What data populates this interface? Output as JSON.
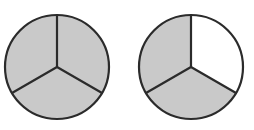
{
  "figure": {
    "background_color": "#ffffff",
    "canvas": {
      "width": 254,
      "height": 130
    },
    "stroke_color": "#2b2b2b",
    "shaded_color": "#c9c9c9",
    "unshaded_color": "#ffffff",
    "stroke_width": 2.2,
    "sector_count": 3,
    "circles": [
      {
        "name": "left-circle",
        "label": "Circle 1 — three thirds shaded",
        "center_x": 57,
        "center_y": 67,
        "radius": 52,
        "shaded_sectors": 3,
        "total_sectors": 3,
        "fraction": "3/3",
        "sectors": [
          {
            "name": "top-right-sector",
            "start_angle_deg": 90,
            "end_angle_deg": -30,
            "shaded": true
          },
          {
            "name": "bottom-sector",
            "start_angle_deg": -30,
            "end_angle_deg": -150,
            "shaded": true
          },
          {
            "name": "top-left-sector",
            "start_angle_deg": -150,
            "end_angle_deg": -270,
            "shaded": true
          }
        ]
      },
      {
        "name": "right-circle",
        "label": "Circle 2 — two thirds shaded",
        "center_x": 191,
        "center_y": 67,
        "radius": 52,
        "shaded_sectors": 2,
        "total_sectors": 3,
        "fraction": "2/3",
        "sectors": [
          {
            "name": "top-right-sector",
            "start_angle_deg": 90,
            "end_angle_deg": -30,
            "shaded": false
          },
          {
            "name": "bottom-sector",
            "start_angle_deg": -30,
            "end_angle_deg": -150,
            "shaded": true
          },
          {
            "name": "top-left-sector",
            "start_angle_deg": -150,
            "end_angle_deg": -270,
            "shaded": true
          }
        ]
      }
    ]
  },
  "chart_data": {
    "type": "pie",
    "xlabel": "",
    "ylabel": "",
    "legend_position": "none",
    "grid": false,
    "series": [
      {
        "name": "Circle 1",
        "categories": [
          "top-right",
          "bottom",
          "top-left"
        ],
        "values": [
          33.3,
          33.3,
          33.3
        ],
        "shaded": [
          true,
          true,
          true
        ],
        "shaded_count": 3,
        "total_count": 3,
        "fraction": "3/3"
      },
      {
        "name": "Circle 2",
        "categories": [
          "top-right",
          "bottom",
          "top-left"
        ],
        "values": [
          33.3,
          33.3,
          33.3
        ],
        "shaded": [
          false,
          true,
          true
        ],
        "shaded_count": 2,
        "total_count": 3,
        "fraction": "2/3"
      }
    ]
  }
}
